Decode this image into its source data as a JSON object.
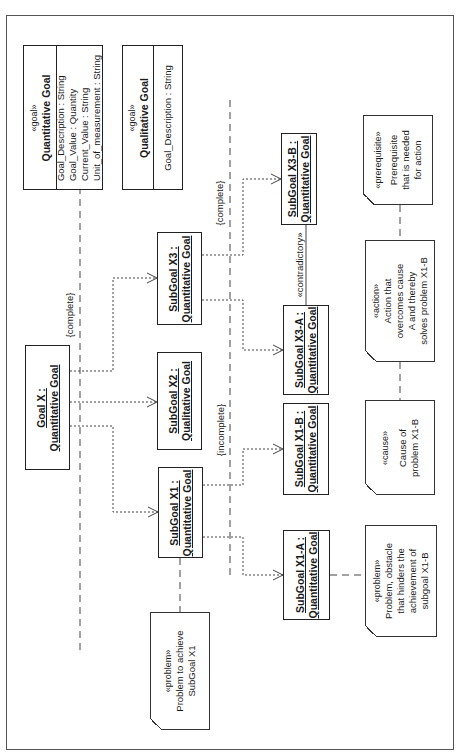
{
  "diagram": {
    "orientation": "rotated-90-ccw",
    "classes": [
      {
        "id": "quantitative-goal",
        "stereotype": "«goal»",
        "name": "Quantitative Goal",
        "attributes": [
          "Goal_Description : String",
          "Goal_Value : Quantity",
          "Current_Value : String",
          "Unit_of_measurement : String"
        ]
      },
      {
        "id": "qualitative-goal",
        "stereotype": "«goal»",
        "name": "Qualitative Goal",
        "attributes": [
          "Goal_Description : String"
        ]
      }
    ],
    "objects": {
      "goal_x": {
        "line1": "Goal X :",
        "line2": "Quantitative Goal"
      },
      "subgoal_x1": {
        "line1": "SubGoal X1 :",
        "line2": "Quantitative Goal"
      },
      "subgoal_x2": {
        "line1": "SubGoal X2 :",
        "line2": "Qualitative Goal"
      },
      "subgoal_x3": {
        "line1": "SubGoal X3 :",
        "line2": "Quantitative Goal"
      },
      "subgoal_x1a": {
        "line1": "SubGoal X1-A :",
        "line2": "Quantitative Goal"
      },
      "subgoal_x1b": {
        "line1": "SubGoal X1-B :",
        "line2": "Quantitative Goal"
      },
      "subgoal_x3a": {
        "line1": "SubGoal X3-A :",
        "line2": "Quantitative Goal"
      },
      "subgoal_x3b": {
        "line1": "SubGoal X3-B :",
        "line2": "Quantitative Goal"
      }
    },
    "constraints": {
      "goal_x_decomposition": "{complete}",
      "subgoal_x1_decomposition": "{incomplete}",
      "subgoal_x3_decomposition": "{complete}",
      "x3a_x3b_relation": "«contradictory»"
    },
    "notes": {
      "problem_x1": {
        "stereotype": "«problem»",
        "lines": [
          "Problem to achieve",
          "SubGoal X1"
        ]
      },
      "problem_x1b": {
        "stereotype": "«problem»",
        "lines": [
          "Problem, obstacle",
          "that hinders the",
          "achievement of",
          "subgoal X1-B"
        ]
      },
      "cause": {
        "stereotype": "«cause»",
        "lines": [
          "Cause of",
          "problem X1-B"
        ]
      },
      "action": {
        "stereotype": "«action»",
        "lines": [
          "Action that",
          "overcomes cause",
          "A and thereby",
          "solves problem X1-B"
        ]
      },
      "prerequisite": {
        "stereotype": "«prerequisite»",
        "lines": [
          "Prerequisite",
          "that is needed",
          "for action"
        ]
      }
    }
  }
}
